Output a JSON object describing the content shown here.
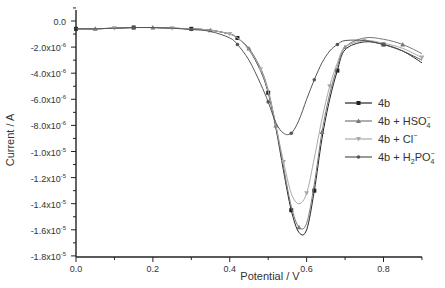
{
  "chart_data": {
    "type": "line",
    "title": "",
    "xlabel": "Potential / V",
    "ylabel": "Current / A",
    "xlim": [
      0.0,
      0.9
    ],
    "ylim": [
      -1.8e-05,
      1e-06
    ],
    "grid": false,
    "legend_position": "right-middle",
    "x_ticks": [
      "0.0",
      "0.2",
      "0.4",
      "0.6",
      "0.8"
    ],
    "y_ticks": [
      {
        "label": "0.0",
        "value": 0
      },
      {
        "label": "-2.0x10",
        "exp": "-6",
        "value": -2e-06
      },
      {
        "label": "-4.0x10",
        "exp": "-6",
        "value": -4e-06
      },
      {
        "label": "-6.0x10",
        "exp": "-6",
        "value": -6e-06
      },
      {
        "label": "-8.0x10",
        "exp": "-6",
        "value": -8e-06
      },
      {
        "label": "-1.0x10",
        "exp": "-5",
        "value": -1e-05
      },
      {
        "label": "-1.2x10",
        "exp": "-5",
        "value": -1.2e-05
      },
      {
        "label": "-1.4x10",
        "exp": "-5",
        "value": -1.4e-05
      },
      {
        "label": "-1.6x10",
        "exp": "-5",
        "value": -1.6e-05
      },
      {
        "label": "-1.8x10",
        "exp": "-5",
        "value": -1.8e-05
      }
    ],
    "x": [
      0.0,
      0.05,
      0.1,
      0.15,
      0.2,
      0.25,
      0.3,
      0.35,
      0.4,
      0.42,
      0.45,
      0.48,
      0.5,
      0.52,
      0.54,
      0.56,
      0.58,
      0.6,
      0.62,
      0.64,
      0.66,
      0.68,
      0.7,
      0.75,
      0.8,
      0.85,
      0.9
    ],
    "series": [
      {
        "name": "4b",
        "sub": "",
        "sup": "",
        "color": "#222222",
        "marker": "square",
        "values": [
          -6e-07,
          -6e-07,
          -5.5e-07,
          -5e-07,
          -5e-07,
          -5.5e-07,
          -6e-07,
          -7e-07,
          -1e-06,
          -1.3e-06,
          -2.2e-06,
          -3.8e-06,
          -5.5e-06,
          -8.2e-06,
          -1.15e-05,
          -1.45e-05,
          -1.62e-05,
          -1.6e-05,
          -1.3e-05,
          -9e-06,
          -6e-06,
          -3.8e-06,
          -2.2e-06,
          -1.6e-06,
          -1.8e-06,
          -2.3e-06,
          -3.2e-06
        ]
      },
      {
        "name": "4b + HSO",
        "sub": "4",
        "sup": "−",
        "color": "#777777",
        "marker": "triangle",
        "values": [
          -6e-07,
          -6e-07,
          -5.5e-07,
          -5e-07,
          -5e-07,
          -5.5e-07,
          -6e-07,
          -7e-07,
          -1e-06,
          -1.3e-06,
          -2.1e-06,
          -3.6e-06,
          -5.3e-06,
          -8e-06,
          -1.12e-05,
          -1.42e-05,
          -1.58e-05,
          -1.55e-05,
          -1.25e-05,
          -8.5e-06,
          -5.6e-06,
          -3.5e-06,
          -2e-06,
          -1.3e-06,
          -1.4e-06,
          -1.8e-06,
          -2.5e-06
        ]
      },
      {
        "name": "4b + Cl",
        "sub": "",
        "sup": "−",
        "color": "#aaaaaa",
        "marker": "triangle-down",
        "values": [
          -6e-07,
          -6e-07,
          -5.5e-07,
          -5e-07,
          -5e-07,
          -5.5e-07,
          -6e-07,
          -7e-07,
          -1e-06,
          -1.3e-06,
          -2.2e-06,
          -3.7e-06,
          -5.4e-06,
          -8e-06,
          -1.08e-05,
          -1.32e-05,
          -1.4e-05,
          -1.32e-05,
          -1.05e-05,
          -7.5e-06,
          -5e-06,
          -3.2e-06,
          -2e-06,
          -1.5e-06,
          -1.7e-06,
          -2.1e-06,
          -2.8e-06
        ]
      },
      {
        "name": "4b + H",
        "sub": "2",
        "name2": "PO",
        "sub2": "4",
        "sup": "−",
        "color": "#555555",
        "marker": "star",
        "values": [
          -6e-07,
          -6e-07,
          -5.5e-07,
          -5e-07,
          -5e-07,
          -5.5e-07,
          -6.5e-07,
          -8e-07,
          -1.3e-06,
          -1.8e-06,
          -3e-06,
          -4.8e-06,
          -6.2e-06,
          -7.8e-06,
          -8.6e-06,
          -8.6e-06,
          -7.6e-06,
          -6e-06,
          -4.5e-06,
          -3.2e-06,
          -2.3e-06,
          -1.8e-06,
          -1.5e-06,
          -1.5e-06,
          -1.8e-06,
          -2.3e-06,
          -3e-06
        ]
      }
    ]
  }
}
